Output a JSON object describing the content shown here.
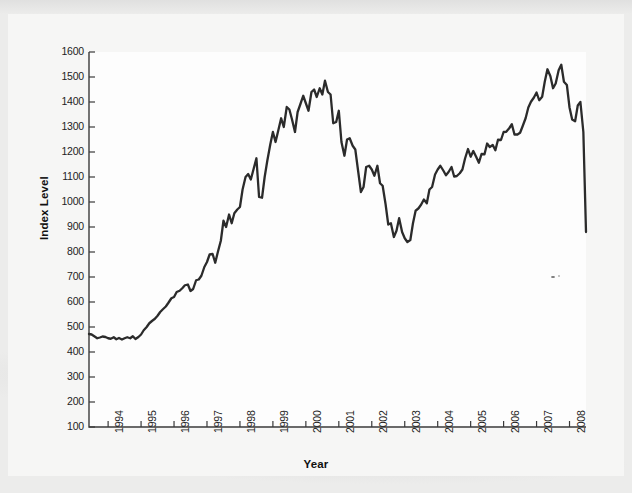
{
  "figure": {
    "background_color": "#ececeb",
    "plot_background_color": "#fdfdfd",
    "line_color": "#2b2b2b",
    "axis_color": "#3a3a3a"
  },
  "chart_data": {
    "type": "line",
    "title": "",
    "xlabel": "Year",
    "ylabel": "Index Level",
    "xlim": [
      1993.42,
      2008.5
    ],
    "ylim": [
      100,
      1600
    ],
    "grid": false,
    "legend": null,
    "x_tick_labels": [
      "1994",
      "1995",
      "1996",
      "1997",
      "1998",
      "1999",
      "2000",
      "2001",
      "2002",
      "2003",
      "2004",
      "2005",
      "2006",
      "2007",
      "2008"
    ],
    "x_tick_values": [
      1994,
      1995,
      1996,
      1997,
      1998,
      1999,
      2000,
      2001,
      2002,
      2003,
      2004,
      2005,
      2006,
      2007,
      2008
    ],
    "y_tick_labels": [
      "1600",
      "1500",
      "1400",
      "1300",
      "1200",
      "1100",
      "1000",
      "900",
      "800",
      "700",
      "600",
      "500",
      "400",
      "300",
      "200",
      "100"
    ],
    "y_tick_values": [
      1600,
      1500,
      1400,
      1300,
      1200,
      1100,
      1000,
      900,
      800,
      700,
      600,
      500,
      400,
      300,
      200,
      100
    ],
    "series": [
      {
        "name": "Index Level",
        "x": [
          1993.42,
          1993.5,
          1993.58,
          1993.67,
          1993.75,
          1993.83,
          1993.92,
          1994.0,
          1994.08,
          1994.17,
          1994.25,
          1994.33,
          1994.42,
          1994.5,
          1994.58,
          1994.67,
          1994.75,
          1994.83,
          1994.92,
          1995.0,
          1995.08,
          1995.17,
          1995.25,
          1995.33,
          1995.42,
          1995.5,
          1995.58,
          1995.67,
          1995.75,
          1995.83,
          1995.92,
          1996.0,
          1996.08,
          1996.17,
          1996.25,
          1996.33,
          1996.42,
          1996.5,
          1996.58,
          1996.67,
          1996.75,
          1996.83,
          1996.92,
          1997.0,
          1997.08,
          1997.17,
          1997.25,
          1997.33,
          1997.42,
          1997.5,
          1997.58,
          1997.67,
          1997.75,
          1997.83,
          1997.92,
          1998.0,
          1998.08,
          1998.17,
          1998.25,
          1998.33,
          1998.42,
          1998.5,
          1998.58,
          1998.67,
          1998.75,
          1998.83,
          1998.92,
          1999.0,
          1999.08,
          1999.17,
          1999.25,
          1999.33,
          1999.42,
          1999.5,
          1999.58,
          1999.67,
          1999.75,
          1999.83,
          1999.92,
          2000.0,
          2000.08,
          2000.17,
          2000.25,
          2000.33,
          2000.42,
          2000.5,
          2000.58,
          2000.67,
          2000.75,
          2000.83,
          2000.92,
          2001.0,
          2001.08,
          2001.17,
          2001.25,
          2001.33,
          2001.42,
          2001.5,
          2001.58,
          2001.67,
          2001.75,
          2001.83,
          2001.92,
          2002.0,
          2002.08,
          2002.17,
          2002.25,
          2002.33,
          2002.42,
          2002.5,
          2002.58,
          2002.67,
          2002.75,
          2002.83,
          2002.92,
          2003.0,
          2003.08,
          2003.17,
          2003.25,
          2003.33,
          2003.42,
          2003.5,
          2003.58,
          2003.67,
          2003.75,
          2003.83,
          2003.92,
          2004.0,
          2004.08,
          2004.17,
          2004.25,
          2004.33,
          2004.42,
          2004.5,
          2004.58,
          2004.67,
          2004.75,
          2004.83,
          2004.92,
          2005.0,
          2005.08,
          2005.17,
          2005.25,
          2005.33,
          2005.42,
          2005.5,
          2005.58,
          2005.67,
          2005.75,
          2005.83,
          2005.92,
          2006.0,
          2006.08,
          2006.17,
          2006.25,
          2006.33,
          2006.42,
          2006.5,
          2006.58,
          2006.67,
          2006.75,
          2006.83,
          2006.92,
          2007.0,
          2007.08,
          2007.17,
          2007.25,
          2007.33,
          2007.42,
          2007.5,
          2007.58,
          2007.67,
          2007.75,
          2007.83,
          2007.92,
          2008.0,
          2008.08,
          2008.17,
          2008.25,
          2008.33,
          2008.42,
          2008.5
        ],
        "y": [
          472,
          470,
          463,
          455,
          458,
          462,
          460,
          455,
          453,
          459,
          451,
          456,
          450,
          455,
          459,
          455,
          463,
          452,
          460,
          470,
          487,
          500,
          515,
          524,
          533,
          545,
          560,
          572,
          582,
          597,
          615,
          620,
          640,
          645,
          655,
          667,
          670,
          644,
          652,
          687,
          690,
          705,
          740,
          760,
          790,
          792,
          757,
          800,
          845,
          925,
          900,
          950,
          915,
          955,
          970,
          980,
          1050,
          1100,
          1112,
          1090,
          1135,
          1175,
          1020,
          1017,
          1100,
          1165,
          1230,
          1280,
          1240,
          1290,
          1335,
          1300,
          1380,
          1370,
          1330,
          1280,
          1360,
          1390,
          1425,
          1395,
          1365,
          1440,
          1450,
          1420,
          1455,
          1430,
          1485,
          1440,
          1430,
          1315,
          1320,
          1365,
          1240,
          1185,
          1250,
          1255,
          1225,
          1210,
          1130,
          1040,
          1060,
          1140,
          1145,
          1130,
          1105,
          1145,
          1075,
          1065,
          990,
          910,
          915,
          860,
          885,
          935,
          880,
          855,
          840,
          848,
          915,
          965,
          975,
          990,
          1010,
          995,
          1050,
          1060,
          1110,
          1130,
          1145,
          1126,
          1107,
          1120,
          1140,
          1102,
          1104,
          1115,
          1130,
          1174,
          1212,
          1181,
          1204,
          1180,
          1157,
          1192,
          1191,
          1234,
          1220,
          1228,
          1207,
          1249,
          1248,
          1280,
          1281,
          1295,
          1311,
          1270,
          1270,
          1277,
          1304,
          1336,
          1378,
          1401,
          1418,
          1438,
          1407,
          1421,
          1482,
          1531,
          1503,
          1455,
          1474,
          1527,
          1549,
          1481,
          1468,
          1378,
          1330,
          1323,
          1386,
          1400,
          1280,
          880
        ]
      }
    ],
    "notes": [
      "Scanned figure of a broad equity index, monthly, mid-1993 through mid-2008",
      "Dot-com peak near 1490 around 2000; trough near 840 in late 2002; peak near 1560 in 2007; sharp decline to ~880 at the right edge"
    ]
  }
}
